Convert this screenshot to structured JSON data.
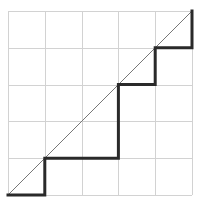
{
  "figure": {
    "background_color": "#ffffff",
    "width": 203,
    "height": 210
  },
  "grid": {
    "label": "square grid",
    "columns": 5,
    "rows": 5,
    "line_color": "#d2d2d2",
    "line_width": 1,
    "cell_size": 36.8,
    "origin_x": 8,
    "origin_y": 11,
    "x_lines": [
      8,
      44.8,
      81.6,
      118.4,
      155.2,
      192
    ],
    "y_lines": [
      11,
      47.8,
      84.6,
      121.4,
      158.2,
      195
    ]
  },
  "chart_data": {
    "type": "line",
    "xlabel": "",
    "ylabel": "",
    "xlim": [
      0,
      5
    ],
    "ylim": [
      0,
      5
    ],
    "grid": true,
    "legend": "none",
    "series": [
      {
        "name": "diagonal",
        "style": "thin",
        "color": "#777777",
        "line_width": 1,
        "x": [
          0,
          5
        ],
        "y": [
          0,
          5
        ],
        "pixel_points": [
          [
            8,
            195
          ],
          [
            192,
            11
          ]
        ]
      },
      {
        "name": "staircase",
        "style": "thick step",
        "color": "#2a2a2a",
        "line_width": 3,
        "x": [
          0,
          1,
          1,
          3,
          3,
          4,
          4,
          5,
          5
        ],
        "y": [
          0,
          0,
          1,
          1,
          3,
          3,
          4,
          4,
          5
        ],
        "pixel_points": [
          [
            8,
            195
          ],
          [
            44.8,
            195
          ],
          [
            44.8,
            158.2
          ],
          [
            118.4,
            158.2
          ],
          [
            118.4,
            84.6
          ],
          [
            155.2,
            84.6
          ],
          [
            155.2,
            47.8
          ],
          [
            192,
            47.8
          ],
          [
            192,
            11
          ]
        ],
        "steps": [
          {
            "tread_x": [
              0,
              1
            ],
            "level_y": 0
          },
          {
            "tread_x": [
              1,
              3
            ],
            "level_y": 1
          },
          {
            "tread_x": [
              3,
              4
            ],
            "level_y": 3
          },
          {
            "tread_x": [
              4,
              5
            ],
            "level_y": 4
          }
        ]
      }
    ]
  }
}
